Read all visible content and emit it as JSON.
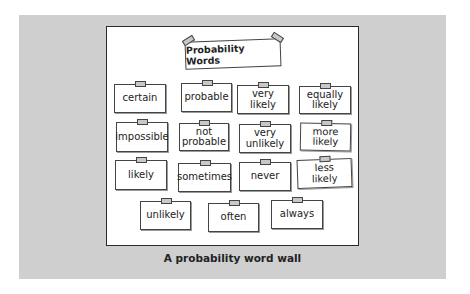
{
  "wall": {
    "title": "Probability Words",
    "cards": [
      {
        "label": "certain"
      },
      {
        "label": "probable"
      },
      {
        "label": "very\nlikely"
      },
      {
        "label": "equally\nlikely"
      },
      {
        "label": "impossible"
      },
      {
        "label": "not\nprobable"
      },
      {
        "label": "very\nunlikely"
      },
      {
        "label": "more\nlikely"
      },
      {
        "label": "likely"
      },
      {
        "label": "sometimes"
      },
      {
        "label": "never"
      },
      {
        "label": "less\nlikely"
      },
      {
        "label": "unlikely"
      },
      {
        "label": "often"
      },
      {
        "label": "always"
      }
    ]
  },
  "caption": "A probability word wall",
  "colors": {
    "panel_background": "#cfcfcf",
    "board_background": "#ffffff",
    "border": "#2a2a2a",
    "tape": "#c8c8c8"
  }
}
